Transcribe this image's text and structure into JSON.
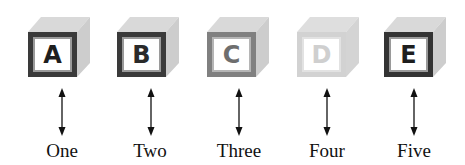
{
  "diagram": {
    "blocks": [
      {
        "letter": "A",
        "label": "One",
        "frame_color": "#3a3a3a",
        "letter_color": "#1e1e1e",
        "shade": "dark"
      },
      {
        "letter": "B",
        "label": "Two",
        "frame_color": "#3a3a3a",
        "letter_color": "#2a2a2a",
        "shade": "dark"
      },
      {
        "letter": "C",
        "label": "Three",
        "frame_color": "#808080",
        "letter_color": "#6e6e6e",
        "shade": "medium"
      },
      {
        "letter": "D",
        "label": "Four",
        "frame_color": "#d2d2d2",
        "letter_color": "#cfcfcf",
        "shade": "light"
      },
      {
        "letter": "E",
        "label": "Five",
        "frame_color": "#333333",
        "letter_color": "#1e1e1e",
        "shade": "dark"
      }
    ],
    "connector": "double-headed vertical arrow"
  }
}
